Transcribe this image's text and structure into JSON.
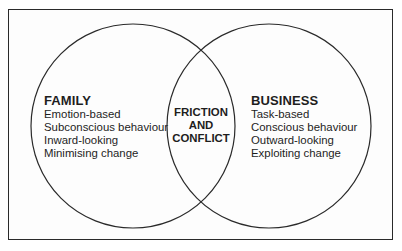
{
  "diagram": {
    "type": "venn",
    "colors": {
      "stroke": "#2a2a2a",
      "text": "#1e1e1e",
      "background": "#ffffff"
    },
    "sets": [
      {
        "id": "family",
        "title": "FAMILY",
        "items": [
          "Emotion-based",
          "Subconscious behaviour",
          "Inward-looking",
          "Minimising change"
        ]
      },
      {
        "id": "business",
        "title": "BUSINESS",
        "items": [
          "Task-based",
          "Conscious behaviour",
          "Outward-looking",
          "Exploiting change"
        ]
      }
    ],
    "intersection": {
      "lines": [
        "FRICTION",
        "AND",
        "CONFLICT"
      ]
    }
  }
}
